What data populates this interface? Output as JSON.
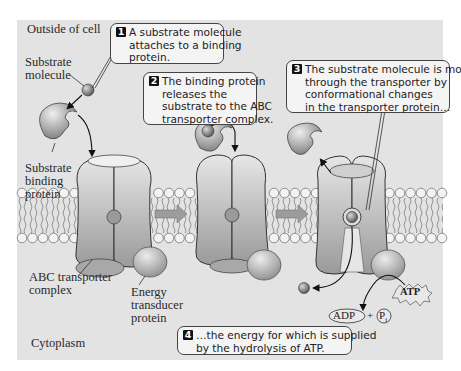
{
  "figure": {
    "type": "ABC transporter mechanism diagram",
    "colors": {
      "page_background": "#ffffff",
      "panel_background": "#e3e3e3",
      "protein_fill": "#b8b8b8",
      "protein_dark": "#8a8a8a",
      "substrate": "#7a7a7a",
      "membrane_head": "#f2f2f2",
      "callout_fill": "#f4f4f4",
      "text": "#222222"
    }
  },
  "regions": {
    "outside": "Outside of cell",
    "inside": "Cytoplasm"
  },
  "labels": {
    "substrate_molecule": [
      "Substrate",
      "molecule"
    ],
    "substrate_binding_protein": [
      "Substrate",
      "binding",
      "protein"
    ],
    "abc_transporter": [
      "ABC transporter",
      "complex"
    ],
    "energy_transducer": [
      "Energy",
      "transducer",
      "protein"
    ]
  },
  "steps": [
    {
      "number": "1",
      "lines": [
        "A substrate molecule",
        "attaches to a binding",
        "protein."
      ]
    },
    {
      "number": "2",
      "lines": [
        "The binding protein",
        "releases the",
        "substrate to the ABC",
        "transporter complex."
      ]
    },
    {
      "number": "3",
      "lines": [
        "The substrate molecule is moved",
        "through the transporter by",
        "conformational changes",
        "in the transporter protein…"
      ]
    },
    {
      "number": "4",
      "lines": [
        "…the energy for which is supplied",
        "by the hydrolysis of ATP."
      ]
    }
  ],
  "chemistry": {
    "atp": "ATP",
    "adp": "ADP",
    "plus": "+",
    "pi": "P",
    "pi_subscript": "i"
  },
  "icons": {
    "substrate": "substrate-molecule-icon",
    "binding_protein": "binding-protein-icon",
    "transporter": "abc-transporter-icon",
    "transducer": "energy-transducer-icon",
    "arrow": "process-arrow-icon"
  }
}
